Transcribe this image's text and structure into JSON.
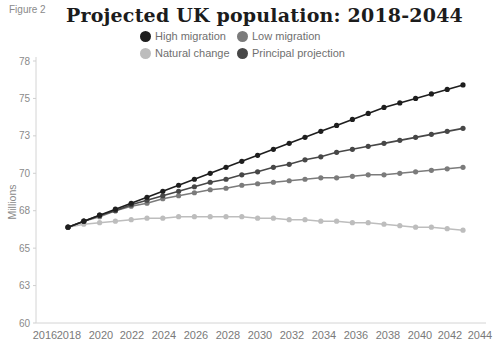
{
  "figure_label": "Figure 2",
  "chart_data": {
    "type": "line",
    "title": "Projected UK population: 2018-2044",
    "xlabel": "",
    "ylabel": "Millions",
    "ylim": [
      60,
      77.5
    ],
    "xlim": [
      2016,
      2044
    ],
    "grid": false,
    "legend_position": "top-center",
    "y_ticks": [
      60,
      62.5,
      65,
      67.5,
      70,
      72.5,
      75,
      77.5
    ],
    "y_tick_labels": [
      "60",
      "63",
      "65",
      "68",
      "70",
      "73",
      "75",
      "78"
    ],
    "x_ticks": [
      2016,
      2018,
      2020,
      2022,
      2024,
      2026,
      2028,
      2030,
      2032,
      2034,
      2036,
      2038,
      2040,
      2042,
      2044
    ],
    "x_tick_labels": [
      "2016",
      "2018",
      "2020",
      "2022",
      "2024",
      "2026",
      "2028",
      "2030",
      "2032",
      "2034",
      "2036",
      "2038",
      "2040",
      "2042",
      "2044"
    ],
    "x": [
      2018,
      2019,
      2020,
      2021,
      2022,
      2023,
      2024,
      2025,
      2026,
      2027,
      2028,
      2029,
      2030,
      2031,
      2032,
      2033,
      2034,
      2035,
      2036,
      2037,
      2038,
      2039,
      2040,
      2041,
      2042,
      2043
    ],
    "series": [
      {
        "name": "High migration",
        "color": "#1e1e1e",
        "values": [
          66.4,
          66.8,
          67.2,
          67.6,
          68.0,
          68.4,
          68.8,
          69.2,
          69.6,
          70.0,
          70.4,
          70.8,
          71.2,
          71.6,
          72.0,
          72.4,
          72.8,
          73.2,
          73.6,
          74.0,
          74.4,
          74.7,
          75.0,
          75.3,
          75.6,
          75.9
        ]
      },
      {
        "name": "Low migration",
        "color": "#7b7b7b",
        "values": [
          66.4,
          66.8,
          67.1,
          67.5,
          67.8,
          68.0,
          68.3,
          68.5,
          68.7,
          68.9,
          69.0,
          69.2,
          69.3,
          69.4,
          69.5,
          69.6,
          69.7,
          69.7,
          69.8,
          69.9,
          69.9,
          70.0,
          70.1,
          70.2,
          70.3,
          70.4
        ]
      },
      {
        "name": "Natural change",
        "color": "#bdbdbd",
        "values": [
          66.4,
          66.6,
          66.7,
          66.8,
          66.9,
          67.0,
          67.0,
          67.1,
          67.1,
          67.1,
          67.1,
          67.1,
          67.0,
          67.0,
          66.9,
          66.9,
          66.8,
          66.8,
          66.7,
          66.7,
          66.6,
          66.5,
          66.4,
          66.4,
          66.3,
          66.2
        ]
      },
      {
        "name": "Principal projection",
        "color": "#474747",
        "values": [
          66.4,
          66.8,
          67.2,
          67.5,
          67.9,
          68.2,
          68.5,
          68.8,
          69.1,
          69.4,
          69.6,
          69.9,
          70.1,
          70.4,
          70.6,
          70.9,
          71.1,
          71.4,
          71.6,
          71.8,
          72.0,
          72.2,
          72.4,
          72.6,
          72.8,
          73.0
        ]
      }
    ]
  }
}
